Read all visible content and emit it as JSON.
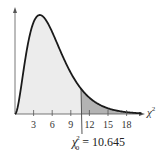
{
  "chart_data": {
    "type": "area",
    "title": "",
    "distribution": "chi-square",
    "degrees_of_freedom": 6,
    "xlabel": "χ²",
    "ylabel": "",
    "x_ticks": [
      3,
      6,
      9,
      12,
      15,
      18
    ],
    "xlim": [
      0,
      20
    ],
    "grid": false,
    "critical_value": 10.645,
    "critical_label": "χ₀² = 10.645",
    "regions": [
      {
        "name": "left",
        "from": 0,
        "to": 10.645,
        "fill": "#ececec"
      },
      {
        "name": "right-tail",
        "from": 10.645,
        "to": 20,
        "fill": "#b3b3b3"
      }
    ],
    "curve_color": "#1a1a1a"
  },
  "labels": {
    "x_axis": "χ",
    "x_axis_sup": "2",
    "crit_chi": "χ",
    "crit_sup": "2",
    "crit_sub": "0",
    "crit_rest": " = 10.645",
    "ticks": [
      "3",
      "6",
      "9",
      "12",
      "15",
      "18"
    ]
  }
}
